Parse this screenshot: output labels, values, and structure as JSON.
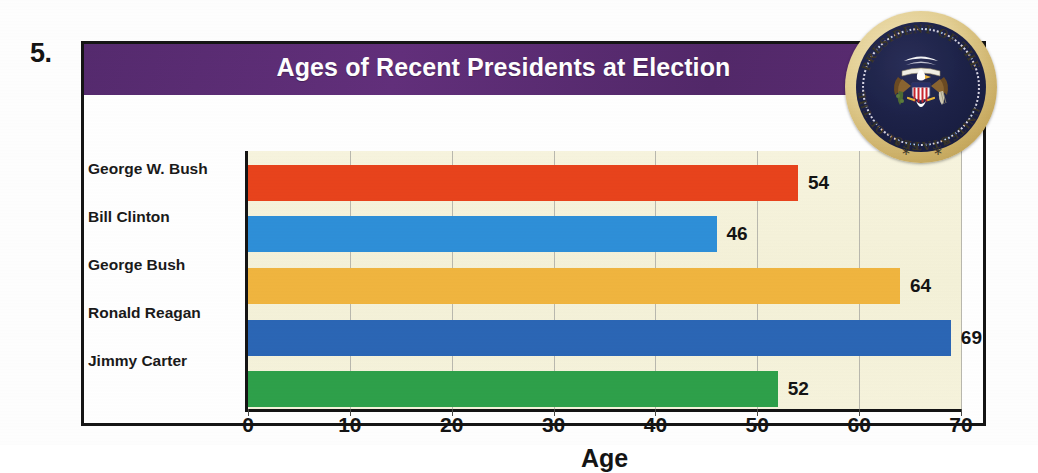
{
  "exercise": {
    "number": "5."
  },
  "figure": {
    "title": "Ages of Recent Presidents at Election",
    "title_band_color": "#5c2a72",
    "plot_background_color": "#f6f3dc",
    "frame_color": "#151515"
  },
  "seal": {
    "name": "presidential-seal",
    "ring_text_top": "PRESIDENT OF THE",
    "ring_text_right": "UNITED",
    "ring_text_bottom": "STATES",
    "ring_text_left": "SEAL OF THE",
    "star_left": "∗",
    "star_right": "∗",
    "rim_color": "#caad63",
    "field_color": "#1e2349"
  },
  "chart_data": {
    "type": "bar",
    "orientation": "horizontal",
    "title": "Ages of Recent Presidents at Election",
    "xlabel": "Age",
    "ylabel": "",
    "xlim": [
      0,
      70
    ],
    "xticks": [
      0,
      10,
      20,
      30,
      40,
      50,
      60,
      70
    ],
    "xtick_labels": [
      "0",
      "10",
      "20",
      "30",
      "40",
      "50",
      "60",
      "70"
    ],
    "grid": "vertical",
    "legend": "none",
    "categories": [
      "George W. Bush",
      "Bill Clinton",
      "George Bush",
      "Ronald Reagan",
      "Jimmy Carter"
    ],
    "values": [
      54,
      46,
      64,
      69,
      52
    ],
    "value_labels": [
      "54",
      "46",
      "64",
      "69",
      "52"
    ],
    "colors": [
      "#e8431c",
      "#2e8fd8",
      "#f0b53f",
      "#2b66b5",
      "#2ea04a"
    ],
    "bars": [
      {
        "label": "George W. Bush",
        "value": 54,
        "value_label": "54",
        "color": "#e8431c"
      },
      {
        "label": "Bill Clinton",
        "value": 46,
        "value_label": "46",
        "color": "#2e8fd8"
      },
      {
        "label": "George Bush",
        "value": 64,
        "value_label": "64",
        "color": "#f0b53f"
      },
      {
        "label": "Ronald Reagan",
        "value": 69,
        "value_label": "69",
        "color": "#2b66b5"
      },
      {
        "label": "Jimmy Carter",
        "value": 52,
        "value_label": "52",
        "color": "#2ea04a"
      }
    ]
  }
}
